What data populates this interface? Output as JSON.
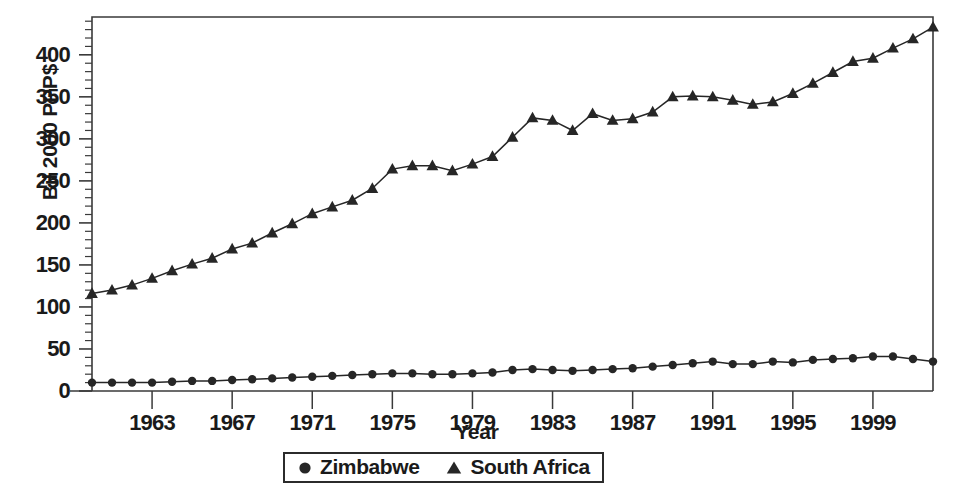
{
  "chart_data": {
    "type": "line",
    "title": "",
    "xlabel": "Year",
    "ylabel": "Bil 2000 PPP$",
    "xlim": [
      1960,
      2002
    ],
    "ylim": [
      0,
      445
    ],
    "grid": false,
    "legend_position": "bottom-center",
    "x": [
      1960,
      1961,
      1962,
      1963,
      1964,
      1965,
      1966,
      1967,
      1968,
      1969,
      1970,
      1971,
      1972,
      1973,
      1974,
      1975,
      1976,
      1977,
      1978,
      1979,
      1980,
      1981,
      1982,
      1983,
      1984,
      1985,
      1986,
      1987,
      1988,
      1989,
      1990,
      1991,
      1992,
      1993,
      1994,
      1995,
      1996,
      1997,
      1998,
      1999,
      2000,
      2001,
      2002
    ],
    "xticks": [
      1963,
      1967,
      1971,
      1975,
      1979,
      1983,
      1987,
      1991,
      1995,
      1999
    ],
    "xtick_labels": [
      "1963",
      "1967",
      "1971",
      "1975",
      "1979",
      "1983",
      "1987",
      "1991",
      "1995",
      "1999"
    ],
    "yticks": [
      0,
      50,
      100,
      150,
      200,
      250,
      300,
      350,
      400
    ],
    "ytick_labels": [
      "0",
      "50",
      "100",
      "150",
      "200",
      "250",
      "300",
      "350",
      "400"
    ],
    "yminor_step": 10,
    "series": [
      {
        "name": "Zimbabwe",
        "marker": "circle",
        "color": "#262626",
        "values": [
          10,
          10,
          10,
          10,
          11,
          12,
          12,
          13,
          14,
          15,
          16,
          17,
          18,
          19,
          20,
          21,
          21,
          20,
          20,
          21,
          22,
          25,
          26,
          25,
          24,
          25,
          26,
          27,
          29,
          31,
          33,
          35,
          32,
          32,
          35,
          34,
          37,
          38,
          39,
          41,
          41,
          38,
          35
        ]
      },
      {
        "name": "South Africa",
        "marker": "triangle",
        "color": "#262626",
        "values": [
          116,
          120,
          126,
          134,
          143,
          151,
          158,
          169,
          176,
          188,
          199,
          211,
          219,
          227,
          241,
          264,
          268,
          268,
          262,
          270,
          279,
          302,
          325,
          322,
          310,
          330,
          322,
          324,
          332,
          350,
          351,
          350,
          346,
          341,
          344,
          354,
          366,
          379,
          392,
          396,
          408,
          419,
          433
        ]
      }
    ]
  },
  "axis": {
    "ylabel": "Bil 2000 PPP$",
    "xlabel": "Year"
  },
  "legend": {
    "items": [
      {
        "label": "Zimbabwe",
        "marker": "circle-marker-icon"
      },
      {
        "label": "South Africa",
        "marker": "triangle-marker-icon"
      }
    ]
  }
}
